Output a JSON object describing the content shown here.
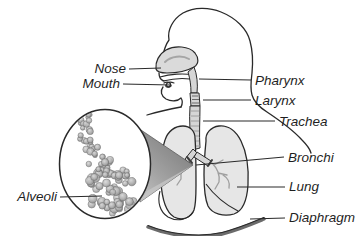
{
  "labels": {
    "nose": "Nose",
    "mouth": "Mouth",
    "pharynx": "Pharynx",
    "larynx": "Larynx",
    "trachea": "Trachea",
    "bronchi": "Bronchi",
    "lung": "Lung",
    "diaphragm": "Diaphragm",
    "alveoli": "Alveoli"
  },
  "colors": {
    "background": "#ffffff",
    "outline": "#2a2a2a",
    "label_text": "#1f1f1f",
    "lung_fill": "#e6e6e6",
    "airway_fill": "#d6d6d6",
    "nasal_fill": "#dadada",
    "cone_dark": "#7f7f7f",
    "cone_light": "#c6c6c6",
    "twig": "#9e9e9e",
    "diaphragm_band": "#6b6b6b"
  }
}
